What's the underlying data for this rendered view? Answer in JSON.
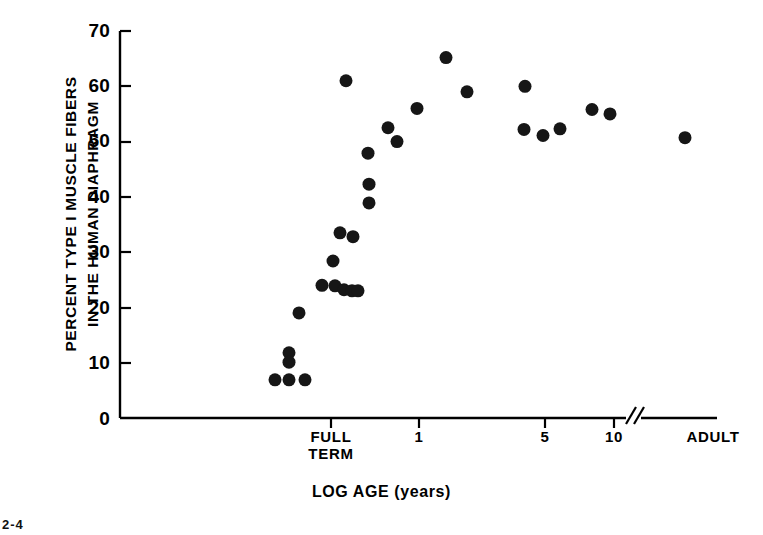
{
  "figure": {
    "corner_mark": "2-4"
  },
  "axes": {
    "y_title_lines": [
      "PERCENT TYPE I MUSCLE FIBERS",
      "IN THE HUMAN DIAPHRAGM"
    ],
    "x_title": "LOG AGE (years)",
    "y_ticks": [
      "0",
      "10",
      "20",
      "30",
      "40",
      "50",
      "60",
      "70"
    ],
    "x_ticks": [
      "FULL TERM",
      "1",
      "5",
      "10",
      "ADULT"
    ],
    "x_tick_1": "FULL",
    "x_tick_1b": "TERM",
    "x_tick_2": "1",
    "x_tick_3": "5",
    "x_tick_4": "10",
    "x_tick_5": "ADULT",
    "axis_break_symbol": "//"
  },
  "chart_data": {
    "type": "scatter",
    "title": "",
    "xlabel": "LOG AGE (years)",
    "ylabel": "PERCENT TYPE I MUSCLE FIBERS IN THE HUMAN DIAPHRAGM",
    "ylim": [
      0,
      70
    ],
    "ytick_values": [
      0,
      10,
      20,
      30,
      40,
      50,
      60,
      70
    ],
    "xtick_labels": [
      "FULL TERM",
      "1",
      "5",
      "10",
      "ADULT"
    ],
    "xtick_px": [
      331,
      419,
      545,
      614,
      717
    ],
    "x_axis_type": "log-with-break",
    "grid": false,
    "legend": null,
    "marker": {
      "shape": "circle",
      "color": "#161616",
      "size_px": 13
    },
    "note": "x stored as pixel position along the broken log axis; y is percent Type I fibers",
    "points": [
      {
        "x_px": 275,
        "y": 6.9
      },
      {
        "x_px": 289,
        "y": 6.9
      },
      {
        "x_px": 305,
        "y": 6.9
      },
      {
        "x_px": 289,
        "y": 11.8
      },
      {
        "x_px": 289,
        "y": 10.1
      },
      {
        "x_px": 299,
        "y": 19.0
      },
      {
        "x_px": 322,
        "y": 24.0
      },
      {
        "x_px": 335,
        "y": 23.9
      },
      {
        "x_px": 344,
        "y": 23.2
      },
      {
        "x_px": 352,
        "y": 23.0
      },
      {
        "x_px": 358,
        "y": 23.0
      },
      {
        "x_px": 333,
        "y": 28.4
      },
      {
        "x_px": 340,
        "y": 33.5
      },
      {
        "x_px": 353,
        "y": 32.8
      },
      {
        "x_px": 369,
        "y": 42.3
      },
      {
        "x_px": 369,
        "y": 38.9
      },
      {
        "x_px": 368,
        "y": 47.9
      },
      {
        "x_px": 346,
        "y": 61.0
      },
      {
        "x_px": 388,
        "y": 52.5
      },
      {
        "x_px": 397,
        "y": 50.0
      },
      {
        "x_px": 417,
        "y": 56.0
      },
      {
        "x_px": 446,
        "y": 65.2
      },
      {
        "x_px": 467,
        "y": 59.0
      },
      {
        "x_px": 525,
        "y": 60.0
      },
      {
        "x_px": 524,
        "y": 52.2
      },
      {
        "x_px": 543,
        "y": 51.1
      },
      {
        "x_px": 560,
        "y": 52.3
      },
      {
        "x_px": 592,
        "y": 55.8
      },
      {
        "x_px": 610,
        "y": 55.0
      },
      {
        "x_px": 685,
        "y": 50.7
      }
    ]
  }
}
